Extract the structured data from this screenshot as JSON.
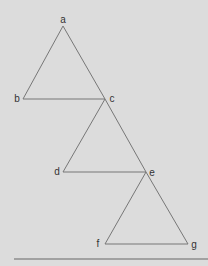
{
  "diagram": {
    "type": "chained-triangles",
    "nodes": [
      {
        "id": "a",
        "label": "a",
        "x": 63,
        "y": 26,
        "lx": 63,
        "ly": 23
      },
      {
        "id": "b",
        "label": "b",
        "x": 23,
        "y": 99,
        "lx": 17,
        "ly": 102
      },
      {
        "id": "c",
        "label": "c",
        "x": 105,
        "y": 99,
        "lx": 112,
        "ly": 102
      },
      {
        "id": "d",
        "label": "d",
        "x": 63,
        "y": 172,
        "lx": 57,
        "ly": 175
      },
      {
        "id": "e",
        "label": "e",
        "x": 146,
        "y": 172,
        "lx": 152,
        "ly": 176
      },
      {
        "id": "f",
        "label": "f",
        "x": 105,
        "y": 244,
        "lx": 98,
        "ly": 247
      },
      {
        "id": "g",
        "label": "g",
        "x": 188,
        "y": 244,
        "lx": 194,
        "ly": 248
      }
    ],
    "edges": [
      [
        "a",
        "b"
      ],
      [
        "a",
        "c"
      ],
      [
        "b",
        "c"
      ],
      [
        "c",
        "d"
      ],
      [
        "c",
        "e"
      ],
      [
        "d",
        "e"
      ],
      [
        "e",
        "f"
      ],
      [
        "e",
        "g"
      ],
      [
        "f",
        "g"
      ]
    ],
    "colors": {
      "background": "#dcdcdc",
      "line": "#777777",
      "label": "#333333",
      "rule": "#666666"
    }
  }
}
